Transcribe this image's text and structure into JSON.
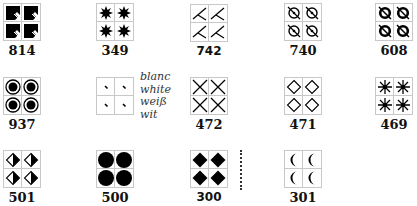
{
  "swatches": [
    {
      "code": "814",
      "symbol": "filled-square-notch"
    },
    {
      "code": "349",
      "symbol": "eight-point-star"
    },
    {
      "code": "742",
      "symbol": "angled-stroke"
    },
    {
      "code": "740",
      "symbol": "circle-dot-slash"
    },
    {
      "code": "608",
      "symbol": "bold-circle-slash"
    },
    {
      "code": "937",
      "symbol": "bullseye"
    },
    {
      "code": "",
      "symbol": "small-tick"
    },
    {
      "code": "472",
      "symbol": "x-cross"
    },
    {
      "code": "471",
      "symbol": "diamond-outline"
    },
    {
      "code": "469",
      "symbol": "asterisk-star"
    },
    {
      "code": "501",
      "symbol": "half-filled-diamond"
    },
    {
      "code": "500",
      "symbol": "filled-circle"
    },
    {
      "code": "300",
      "symbol": "filled-diamond"
    },
    {
      "code": "301",
      "symbol": "crescent"
    }
  ],
  "legend": {
    "lines": [
      "blanc",
      "white",
      "weiß",
      "wit"
    ]
  },
  "colors": {
    "symbol": "#000000",
    "grid_line": "#c8c8c8",
    "label": "#111111"
  }
}
